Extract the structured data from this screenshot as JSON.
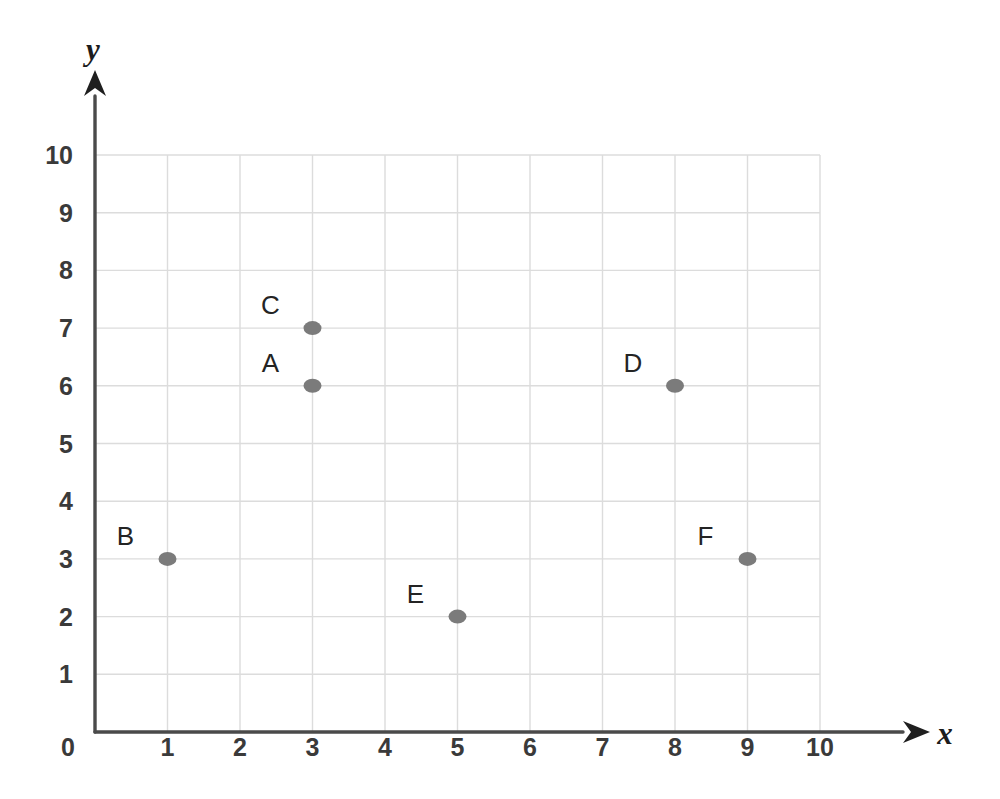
{
  "chart_data": {
    "type": "scatter",
    "title": "",
    "xlabel": "x",
    "ylabel": "y",
    "xlim": [
      0,
      10
    ],
    "ylim": [
      0,
      10
    ],
    "grid": true,
    "legend": "none",
    "x_ticks": [
      "0",
      "1",
      "2",
      "3",
      "4",
      "5",
      "6",
      "7",
      "8",
      "9",
      "10"
    ],
    "y_ticks": [
      "0",
      "1",
      "2",
      "3",
      "4",
      "5",
      "6",
      "7",
      "8",
      "9",
      "10"
    ],
    "marker_color": "#7b7b7b",
    "grid_color": "#dcdcdc",
    "axis_color": "#4a4a4a",
    "points": [
      {
        "label": "A",
        "x": 3,
        "y": 6,
        "label_dx": -42,
        "label_dy": -14
      },
      {
        "label": "B",
        "x": 1,
        "y": 3,
        "label_dx": -42,
        "label_dy": -14
      },
      {
        "label": "C",
        "x": 3,
        "y": 7,
        "label_dx": -42,
        "label_dy": -14
      },
      {
        "label": "D",
        "x": 8,
        "y": 6,
        "label_dx": -42,
        "label_dy": -14
      },
      {
        "label": "E",
        "x": 5,
        "y": 2,
        "label_dx": -42,
        "label_dy": -14
      },
      {
        "label": "F",
        "x": 9,
        "y": 3,
        "label_dx": -42,
        "label_dy": -14
      }
    ]
  },
  "geometry": {
    "origin_x": 95,
    "origin_y": 732,
    "unit_x": 72.5,
    "unit_y": 57.7,
    "marker_rx": 9,
    "marker_ry": 7
  },
  "axes": {
    "x_axis_name": "x",
    "y_axis_name": "y",
    "origin_label": "0"
  }
}
